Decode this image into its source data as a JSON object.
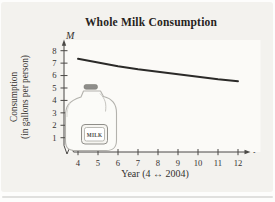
{
  "figure": {
    "title": "Whole Milk Consumption",
    "y_axis_symbol": "M",
    "x_axis_symbol": "t",
    "y_axis_label_line1": "Consumption",
    "y_axis_label_line2": "(in gallons per person)",
    "x_axis_label": "Year (4 ↔ 2004)",
    "milk_jug_label": "MILK"
  },
  "chart_data": {
    "type": "line",
    "title": "Whole Milk Consumption",
    "xlabel": "Year (4 ↔ 2004)",
    "ylabel": "Consumption (in gallons per person)",
    "x_variable": "t",
    "y_variable": "M",
    "x": [
      4,
      5,
      6,
      7,
      8,
      9,
      10,
      11,
      12
    ],
    "series": [
      {
        "name": "Whole milk consumption (gallons per person)",
        "values": [
          7.35,
          7.05,
          6.75,
          6.5,
          6.3,
          6.1,
          5.9,
          5.7,
          5.55
        ]
      }
    ],
    "x_ticks": [
      4,
      5,
      6,
      7,
      8,
      9,
      10,
      11,
      12
    ],
    "y_ticks": [
      1,
      2,
      3,
      4,
      5,
      6,
      7,
      8
    ],
    "xlim": [
      4,
      12
    ],
    "ylim": [
      0,
      8.6
    ],
    "grid": false,
    "legend": false,
    "axis_break": "x-axis near origin",
    "curve_color": "#2b2a28",
    "axis_color": "#4b4946",
    "background_color": "#f3f2ee"
  }
}
